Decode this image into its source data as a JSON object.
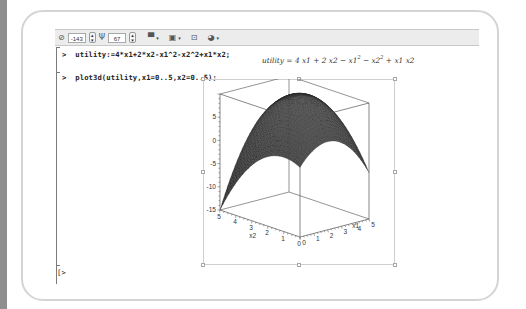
{
  "toolbar": {
    "rotate_theta": "-143",
    "rotate_phi": "67",
    "items": [
      {
        "icon": "orientation-icon",
        "label": "⊘"
      },
      {
        "icon": "spinner-icon",
        "label": "⇕"
      },
      {
        "icon": "tilt-icon",
        "label": "Ψ"
      },
      {
        "icon": "spinner-icon",
        "label": "⇕"
      },
      {
        "icon": "style-icon",
        "label": "▀"
      },
      {
        "icon": "color-icon",
        "label": "▣"
      },
      {
        "icon": "projection-icon",
        "label": "⊡"
      },
      {
        "icon": "lighting-icon",
        "label": "◕"
      }
    ],
    "dropdown_glyph": "▾"
  },
  "worksheet": {
    "prompt_symbol": ">",
    "commands": [
      {
        "input": "utility:=4*x1+2*x2-x1^2-x2^2+x1*x2;"
      },
      {
        "input": "plot3d(utility,x1=0..5,x2=0..5);"
      }
    ],
    "output": {
      "lhs": "utility",
      "eq": " = ",
      "t1": "4 x1 + 2 x2 − x1",
      "sup1": "2",
      "t2": " − x2",
      "sup2": "2",
      "t3": " + x1 x2"
    },
    "empty_prompt": ">"
  },
  "chart_data": {
    "type": "surface3d",
    "title": "",
    "function": "4*x1 + 2*x2 - x1^2 - x2^2 + x1*x2",
    "x_label": "x1",
    "y_label": "x2",
    "z_label": "",
    "x_range": [
      0,
      5
    ],
    "y_range": [
      0,
      5
    ],
    "z_range": [
      -15,
      10
    ],
    "x_ticks": [
      "0",
      "1",
      "2",
      "3",
      "4",
      "5"
    ],
    "y_ticks": [
      "0",
      "1",
      "2",
      "3",
      "4",
      "5"
    ],
    "z_ticks": [
      "5",
      "0",
      "-5",
      "-10",
      "-15"
    ],
    "orientation": {
      "theta": -143,
      "phi": 67
    },
    "style": "patch",
    "surface_color": "#4a4a4a",
    "max_point": {
      "x1": 3.33,
      "x2": 2.67,
      "z": 9.33
    },
    "corner_values": {
      "x1=0,x2=0": 0,
      "x1=5,x2=0": -5,
      "x1=0,x2=5": -15,
      "x1=5,x2=5": 5
    }
  }
}
